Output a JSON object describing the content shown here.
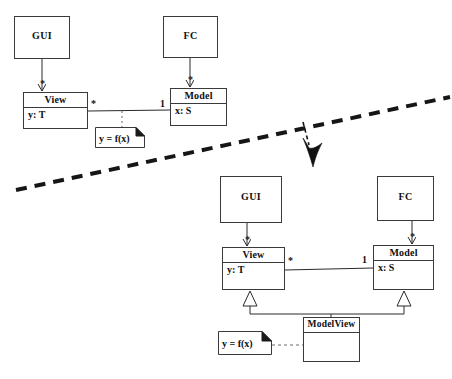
{
  "diagram": {
    "stroke_color": "#3a3a3a",
    "text_color": "#101010",
    "background": "#ffffff",
    "before": {
      "classes": [
        {
          "name": "GUI",
          "attribute": "",
          "x": 14,
          "y": 16,
          "w": 56,
          "h": 43,
          "plain": true
        },
        {
          "name": "FC",
          "attribute": "",
          "x": 163,
          "y": 16,
          "w": 55,
          "h": 42,
          "plain": true
        },
        {
          "name": "View",
          "attribute": "y: T",
          "x": 23,
          "y": 92,
          "w": 65,
          "h": 37,
          "plain": false
        },
        {
          "name": "Model",
          "attribute": "x: S",
          "x": 170,
          "y": 88,
          "w": 57,
          "h": 38,
          "plain": false
        }
      ],
      "note": {
        "text": "y = f(x)",
        "x": 95,
        "y": 127,
        "w": 50,
        "h": 21
      },
      "multiplicities": [
        {
          "label": "*",
          "x": 40,
          "y": 79
        },
        {
          "label": "*",
          "x": 188,
          "y": 75
        },
        {
          "label": "*",
          "x": 91,
          "y": 99
        },
        {
          "label": "1",
          "x": 160,
          "y": 99
        }
      ]
    },
    "after": {
      "classes": [
        {
          "name": "GUI",
          "attribute": "",
          "x": 220,
          "y": 176,
          "w": 62,
          "h": 47,
          "plain": true
        },
        {
          "name": "FC",
          "attribute": "",
          "x": 377,
          "y": 176,
          "w": 57,
          "h": 45,
          "plain": true
        },
        {
          "name": "View",
          "attribute": "y: T",
          "x": 222,
          "y": 247,
          "w": 63,
          "h": 43,
          "plain": false
        },
        {
          "name": "Model",
          "attribute": "x: S",
          "x": 373,
          "y": 245,
          "w": 61,
          "h": 45,
          "plain": false
        },
        {
          "name": "ModelView",
          "attribute": "",
          "x": 303,
          "y": 317,
          "w": 57,
          "h": 45,
          "plain": false
        }
      ],
      "note": {
        "text": "y = f(x)",
        "x": 218,
        "y": 331,
        "w": 54,
        "h": 24
      },
      "multiplicities": [
        {
          "label": "*",
          "x": 245,
          "y": 235
        },
        {
          "label": "*",
          "x": 410,
          "y": 232
        },
        {
          "label": "*",
          "x": 288,
          "y": 256
        },
        {
          "label": "1",
          "x": 362,
          "y": 255
        }
      ]
    },
    "separator": {
      "name": "diagonal-dashed-separator",
      "x1": 16,
      "y1": 190,
      "x2": 450,
      "y2": 97
    },
    "transform_arrow": {
      "name": "transformation-arrow",
      "from_x": 303,
      "from_y": 122,
      "to_x": 313,
      "to_y": 166
    }
  }
}
